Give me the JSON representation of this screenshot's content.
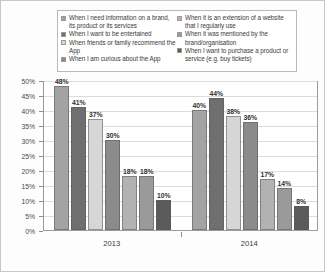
{
  "chart_data": {
    "type": "bar",
    "title": "",
    "subtitle": "",
    "xlabel": "",
    "ylabel": "",
    "categories": [
      "2013",
      "2014"
    ],
    "ylim": [
      0,
      50
    ],
    "ytick_labels": [
      "0%",
      "5%",
      "10%",
      "15%",
      "20%",
      "25%",
      "30%",
      "35%",
      "40%",
      "45%",
      "50%"
    ],
    "ytick_values": [
      0,
      5,
      10,
      15,
      20,
      25,
      30,
      35,
      40,
      45,
      50
    ],
    "grid": true,
    "legend_position": "top",
    "value_suffix": "%",
    "series": [
      {
        "name": "When I need information on a brand, its product or its services",
        "color": "#a3a3a3",
        "values": [
          48,
          40
        ],
        "labels": [
          "48%",
          "40%"
        ]
      },
      {
        "name": "When I want to be entertained",
        "color": "#6f6f6f",
        "values": [
          41,
          44
        ],
        "labels": [
          "41%",
          "44%"
        ]
      },
      {
        "name": "When friends or family recommend the App",
        "color": "#d6d6d6",
        "values": [
          37,
          38
        ],
        "labels": [
          "37%",
          "38%"
        ]
      },
      {
        "name": "When I am curious about the App",
        "color": "#8b8b8b",
        "values": [
          30,
          36
        ],
        "labels": [
          "30%",
          "36%"
        ]
      },
      {
        "name": "When it is an extension of a website that I regularly use",
        "color": "#b2b2b2",
        "values": [
          18,
          17
        ],
        "labels": [
          "18%",
          "17%"
        ]
      },
      {
        "name": "When it was mentioned by the brand/organisation",
        "color": "#9a9a9a",
        "values": [
          18,
          14
        ],
        "labels": [
          "18%",
          "14%"
        ]
      },
      {
        "name": "When I want to purchase a product or service (e.g. buy tickets)",
        "color": "#5b5b5b",
        "values": [
          10,
          8
        ],
        "labels": [
          "10%",
          "8%"
        ]
      }
    ]
  },
  "legend": {
    "left_column": [
      {
        "label": "When I need information on a brand, its product or its services",
        "color": "#a3a3a3"
      },
      {
        "label": "When I want to be entertained",
        "color": "#6f6f6f"
      },
      {
        "label": "When friends or family recommend the App",
        "color": "#d6d6d6"
      },
      {
        "label": "When I am curious about the App",
        "color": "#8b8b8b"
      }
    ],
    "right_column": [
      {
        "label": "When it is an extension of a website that I regularly use",
        "color": "#b2b2b2"
      },
      {
        "label": "When it was mentioned by the brand/organisation",
        "color": "#9a9a9a"
      },
      {
        "label": "When I want to purchase a product or service (e.g. buy tickets)",
        "color": "#5b5b5b"
      }
    ]
  }
}
